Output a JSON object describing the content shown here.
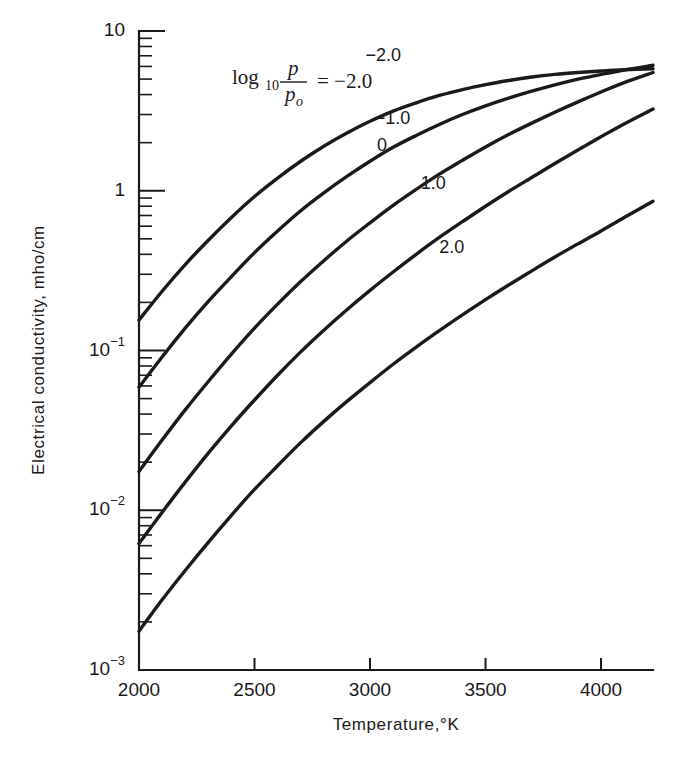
{
  "chart_data": {
    "type": "line",
    "title": "",
    "xlabel": "Temperature,°K",
    "ylabel": "Electrical conductivity, mho/cm",
    "xlim": [
      2000,
      4225
    ],
    "ylim": [
      0.001,
      10
    ],
    "yscale": "log",
    "xscale": "linear",
    "grid": false,
    "legend_position": "inside-upper-left",
    "legend_annotation": {
      "prefix": "log",
      "base": "10",
      "numerator": "p",
      "denominator": "p",
      "denominator_sub": "o",
      "equals": "= −2.0"
    },
    "xticks": [
      2000,
      2500,
      3000,
      3500,
      4000
    ],
    "xtick_labels": [
      "2000",
      "2500",
      "3000",
      "3500",
      "4000"
    ],
    "yticks": [
      10,
      1,
      0.1,
      0.01,
      0.001
    ],
    "ytick_labels": [
      "10",
      "1",
      "10",
      "10",
      "10"
    ],
    "ytick_exponents": [
      "",
      "",
      "−1",
      "−2",
      "−3"
    ],
    "series": [
      {
        "name": "-2.0",
        "label": "−2.0",
        "label_x": 2980,
        "label_y": 6.5,
        "x": [
          2000,
          2100,
          2200,
          2300,
          2400,
          2500,
          2600,
          2700,
          2800,
          2900,
          3000,
          3100,
          3200,
          3300,
          3400,
          3500,
          3600,
          3700,
          3800,
          3900,
          4000,
          4100,
          4225
        ],
        "y": [
          0.155,
          0.235,
          0.345,
          0.49,
          0.68,
          0.92,
          1.2,
          1.53,
          1.9,
          2.3,
          2.72,
          3.15,
          3.55,
          3.95,
          4.3,
          4.62,
          4.9,
          5.15,
          5.35,
          5.5,
          5.62,
          5.72,
          5.8
        ]
      },
      {
        "name": "-1.0",
        "label": "−1.0",
        "label_x": 3020,
        "label_y": 2.6,
        "x": [
          2000,
          2100,
          2200,
          2300,
          2400,
          2500,
          2600,
          2700,
          2800,
          2900,
          3000,
          3100,
          3200,
          3300,
          3400,
          3500,
          3600,
          3700,
          3800,
          3900,
          4000,
          4100,
          4225
        ],
        "y": [
          0.059,
          0.091,
          0.138,
          0.203,
          0.29,
          0.41,
          0.56,
          0.75,
          0.97,
          1.23,
          1.53,
          1.87,
          2.22,
          2.6,
          3.0,
          3.4,
          3.8,
          4.2,
          4.6,
          5.0,
          5.35,
          5.7,
          6.1
        ]
      },
      {
        "name": "0",
        "label": "0",
        "label_x": 3030,
        "label_y": 1.78,
        "x": [
          2000,
          2100,
          2200,
          2300,
          2400,
          2500,
          2600,
          2700,
          2800,
          2900,
          3000,
          3100,
          3200,
          3300,
          3400,
          3500,
          3600,
          3700,
          3800,
          3900,
          4000,
          4100,
          4225
        ],
        "y": [
          0.0175,
          0.0275,
          0.0425,
          0.064,
          0.095,
          0.138,
          0.195,
          0.27,
          0.365,
          0.485,
          0.63,
          0.81,
          1.02,
          1.27,
          1.55,
          1.88,
          2.25,
          2.65,
          3.1,
          3.6,
          4.15,
          4.75,
          5.5
        ]
      },
      {
        "name": "1.0",
        "label": "1.0",
        "label_x": 3220,
        "label_y": 1.02,
        "x": [
          2000,
          2100,
          2200,
          2300,
          2400,
          2500,
          2600,
          2700,
          2800,
          2900,
          3000,
          3100,
          3200,
          3300,
          3400,
          3500,
          3600,
          3700,
          3800,
          3900,
          4000,
          4100,
          4225
        ],
        "y": [
          0.0062,
          0.0097,
          0.015,
          0.0228,
          0.0338,
          0.049,
          0.07,
          0.098,
          0.134,
          0.18,
          0.238,
          0.31,
          0.4,
          0.51,
          0.64,
          0.8,
          0.99,
          1.21,
          1.48,
          1.8,
          2.18,
          2.62,
          3.25
        ]
      },
      {
        "name": "2.0",
        "label": "2.0",
        "label_x": 3300,
        "label_y": 0.41,
        "x": [
          2000,
          2100,
          2200,
          2300,
          2400,
          2500,
          2600,
          2700,
          2800,
          2900,
          3000,
          3100,
          3200,
          3300,
          3400,
          3500,
          3600,
          3700,
          3800,
          3900,
          4000,
          4100,
          4225
        ],
        "y": [
          0.00175,
          0.00275,
          0.0042,
          0.0063,
          0.0093,
          0.0135,
          0.019,
          0.0265,
          0.036,
          0.048,
          0.063,
          0.082,
          0.105,
          0.133,
          0.167,
          0.208,
          0.257,
          0.315,
          0.385,
          0.465,
          0.56,
          0.68,
          0.86
        ]
      }
    ]
  },
  "colors": {
    "ink": "#1a1a1a",
    "background": "#ffffff"
  }
}
